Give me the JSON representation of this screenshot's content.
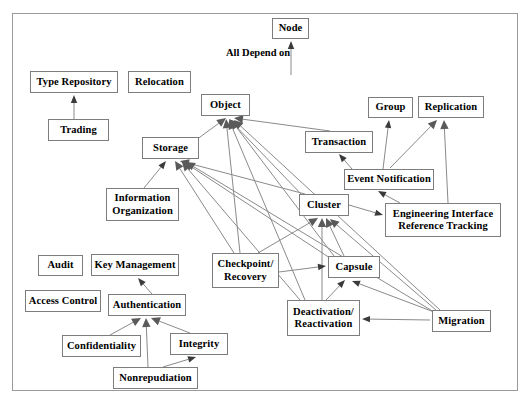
{
  "diagram": {
    "title": "All Depend on",
    "caption": {
      "text": "All Depend on",
      "x": 226,
      "y": 47
    },
    "frame": {
      "x": 12,
      "y": 13,
      "width": 506,
      "height": 378,
      "border_color": "#9a9a9a"
    },
    "style": {
      "node_border_color": "#7d7d7d",
      "node_fill": "#ffffff",
      "edge_color": "#8a8a8a",
      "text_color": "#000000",
      "background": "#ffffff"
    },
    "nodes": [
      {
        "id": "node",
        "label": "Node",
        "x": 272,
        "y": 18,
        "w": 37,
        "h": 21
      },
      {
        "id": "type_repo",
        "label": "Type Repository",
        "x": 30,
        "y": 71,
        "w": 88,
        "h": 22
      },
      {
        "id": "relocation",
        "label": "Relocation",
        "x": 128,
        "y": 71,
        "w": 63,
        "h": 22
      },
      {
        "id": "trading",
        "label": "Trading",
        "x": 48,
        "y": 119,
        "w": 61,
        "h": 22
      },
      {
        "id": "object",
        "label": "Object",
        "x": 201,
        "y": 94,
        "w": 49,
        "h": 22
      },
      {
        "id": "group",
        "label": "Group",
        "x": 368,
        "y": 97,
        "w": 45,
        "h": 21
      },
      {
        "id": "replication",
        "label": "Replication",
        "x": 418,
        "y": 96,
        "w": 66,
        "h": 22
      },
      {
        "id": "storage",
        "label": "Storage",
        "x": 142,
        "y": 137,
        "w": 57,
        "h": 22
      },
      {
        "id": "transaction",
        "label": "Transaction",
        "x": 305,
        "y": 131,
        "w": 68,
        "h": 22
      },
      {
        "id": "event_notif",
        "label": "Event Notification",
        "x": 344,
        "y": 169,
        "w": 90,
        "h": 21
      },
      {
        "id": "info_org",
        "label": "Information\nOrganization",
        "x": 106,
        "y": 188,
        "w": 73,
        "h": 33
      },
      {
        "id": "cluster",
        "label": "Cluster",
        "x": 299,
        "y": 194,
        "w": 50,
        "h": 22
      },
      {
        "id": "eirt",
        "label": "Engineering Interface\nReference Tracking",
        "x": 385,
        "y": 203,
        "w": 116,
        "h": 34
      },
      {
        "id": "audit",
        "label": "Audit",
        "x": 38,
        "y": 255,
        "w": 45,
        "h": 21
      },
      {
        "id": "key_mgmt",
        "label": "Key Management",
        "x": 91,
        "y": 254,
        "w": 88,
        "h": 22
      },
      {
        "id": "checkpoint",
        "label": "Checkpoint/\nRecovery",
        "x": 212,
        "y": 253,
        "w": 67,
        "h": 35
      },
      {
        "id": "capsule",
        "label": "Capsule",
        "x": 328,
        "y": 256,
        "w": 52,
        "h": 22
      },
      {
        "id": "access_ctrl",
        "label": "Access Control",
        "x": 25,
        "y": 290,
        "w": 76,
        "h": 22
      },
      {
        "id": "auth",
        "label": "Authentication",
        "x": 108,
        "y": 294,
        "w": 78,
        "h": 22
      },
      {
        "id": "deact",
        "label": "Deactivation/\nReactivation",
        "x": 287,
        "y": 300,
        "w": 73,
        "h": 36
      },
      {
        "id": "migration",
        "label": "Migration",
        "x": 432,
        "y": 310,
        "w": 59,
        "h": 22
      },
      {
        "id": "confid",
        "label": "Confidentiality",
        "x": 62,
        "y": 335,
        "w": 79,
        "h": 22
      },
      {
        "id": "integrity",
        "label": "Integrity",
        "x": 170,
        "y": 333,
        "w": 58,
        "h": 22
      },
      {
        "id": "nonrep",
        "label": "Nonrepudiation",
        "x": 113,
        "y": 367,
        "w": 85,
        "h": 22
      }
    ],
    "edges": [
      {
        "from": "all_depend_on_stem",
        "to": "node",
        "x1": 291,
        "y1": 75,
        "x2": 291,
        "y2": 41,
        "solid_head": false
      },
      {
        "from": "trading",
        "to": "type_repo",
        "x1": 74,
        "y1": 119,
        "x2": 74,
        "y2": 95,
        "solid_head": false
      },
      {
        "from": "info_org",
        "to": "storage",
        "x1": 144,
        "y1": 188,
        "x2": 166,
        "y2": 161,
        "solid_head": false
      },
      {
        "from": "checkpoint",
        "to": "storage",
        "x1": 234,
        "y1": 253,
        "x2": 175,
        "y2": 161,
        "solid_head": true
      },
      {
        "from": "cluster",
        "to": "storage",
        "x1": 305,
        "y1": 194,
        "x2": 180,
        "y2": 161,
        "solid_head": true
      },
      {
        "from": "deact",
        "to": "storage",
        "x1": 300,
        "y1": 300,
        "x2": 182,
        "y2": 162,
        "solid_head": true
      },
      {
        "from": "capsule",
        "to": "storage",
        "x1": 330,
        "y1": 258,
        "x2": 184,
        "y2": 162,
        "solid_head": true
      },
      {
        "from": "migration",
        "to": "storage",
        "x1": 434,
        "y1": 312,
        "x2": 186,
        "y2": 162,
        "solid_head": true
      },
      {
        "from": "storage",
        "to": "object",
        "x1": 196,
        "y1": 140,
        "x2": 226,
        "y2": 118,
        "solid_head": true
      },
      {
        "from": "cluster",
        "to": "object",
        "x1": 303,
        "y1": 196,
        "x2": 229,
        "y2": 119,
        "solid_head": true
      },
      {
        "from": "checkpoint",
        "to": "object",
        "x1": 240,
        "y1": 253,
        "x2": 226,
        "y2": 119,
        "solid_head": true
      },
      {
        "from": "capsule",
        "to": "object",
        "x1": 334,
        "y1": 256,
        "x2": 231,
        "y2": 120,
        "solid_head": true
      },
      {
        "from": "deact",
        "to": "object",
        "x1": 305,
        "y1": 300,
        "x2": 229,
        "y2": 120,
        "solid_head": true
      },
      {
        "from": "transaction",
        "to": "object",
        "x1": 330,
        "y1": 131,
        "x2": 234,
        "y2": 118,
        "solid_head": true
      },
      {
        "from": "migration",
        "to": "object",
        "x1": 440,
        "y1": 310,
        "x2": 234,
        "y2": 120,
        "solid_head": true
      },
      {
        "from": "event_notif",
        "to": "transaction",
        "x1": 352,
        "y1": 169,
        "x2": 339,
        "y2": 154,
        "solid_head": false
      },
      {
        "from": "event_notif",
        "to": "group",
        "x1": 383,
        "y1": 169,
        "x2": 389,
        "y2": 120,
        "solid_head": false
      },
      {
        "from": "event_notif",
        "to": "replication",
        "x1": 390,
        "y1": 168,
        "x2": 437,
        "y2": 120,
        "solid_head": true
      },
      {
        "from": "eirt",
        "to": "replication",
        "x1": 448,
        "y1": 203,
        "x2": 444,
        "y2": 120,
        "solid_head": true
      },
      {
        "from": "eirt",
        "to": "event_notif",
        "x1": 400,
        "y1": 203,
        "x2": 378,
        "y2": 191,
        "solid_head": false
      },
      {
        "from": "cluster",
        "to": "eirt",
        "x1": 349,
        "y1": 205,
        "x2": 383,
        "y2": 215,
        "solid_head": false
      },
      {
        "from": "checkpoint",
        "to": "cluster",
        "x1": 258,
        "y1": 253,
        "x2": 318,
        "y2": 218,
        "solid_head": true
      },
      {
        "from": "capsule",
        "to": "cluster",
        "x1": 344,
        "y1": 256,
        "x2": 326,
        "y2": 218,
        "solid_head": true
      },
      {
        "from": "deact",
        "to": "cluster",
        "x1": 322,
        "y1": 300,
        "x2": 322,
        "y2": 218,
        "solid_head": true
      },
      {
        "from": "migration",
        "to": "cluster",
        "x1": 436,
        "y1": 310,
        "x2": 330,
        "y2": 219,
        "solid_head": true
      },
      {
        "from": "deact",
        "to": "capsule",
        "x1": 326,
        "y1": 300,
        "x2": 345,
        "y2": 280,
        "solid_head": false
      },
      {
        "from": "checkpoint",
        "to": "capsule",
        "x1": 279,
        "y1": 272,
        "x2": 326,
        "y2": 266,
        "solid_head": false
      },
      {
        "from": "migration",
        "to": "capsule",
        "x1": 434,
        "y1": 312,
        "x2": 352,
        "y2": 281,
        "solid_head": false
      },
      {
        "from": "migration",
        "to": "deact",
        "x1": 430,
        "y1": 320,
        "x2": 362,
        "y2": 319,
        "solid_head": false
      },
      {
        "from": "auth",
        "to": "key_mgmt",
        "x1": 152,
        "y1": 294,
        "x2": 138,
        "y2": 278,
        "solid_head": false
      },
      {
        "from": "confid",
        "to": "auth",
        "x1": 110,
        "y1": 335,
        "x2": 141,
        "y2": 318,
        "solid_head": true
      },
      {
        "from": "nonrep",
        "to": "auth",
        "x1": 148,
        "y1": 367,
        "x2": 146,
        "y2": 318,
        "solid_head": true
      },
      {
        "from": "integrity",
        "to": "auth",
        "x1": 190,
        "y1": 333,
        "x2": 151,
        "y2": 318,
        "solid_head": true
      },
      {
        "from": "nonrep",
        "to": "integrity",
        "x1": 163,
        "y1": 367,
        "x2": 196,
        "y2": 357,
        "solid_head": false
      }
    ]
  }
}
